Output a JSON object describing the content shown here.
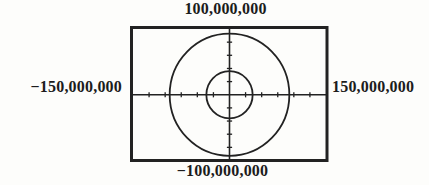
{
  "figure": {
    "window_labels": {
      "ymax": "100,000,000",
      "ymin": "−100,000,000",
      "xmin": "−150,000,000",
      "xmax": "150,000,000"
    }
  },
  "chart_data": {
    "type": "line",
    "title": "",
    "xlabel": "",
    "ylabel": "",
    "xlim": [
      -150000000,
      150000000
    ],
    "ylim": [
      -100000000,
      100000000
    ],
    "xscl": 25000000,
    "yscl": 20000000,
    "grid": false,
    "legend": false,
    "axis_edge_labels": {
      "top": "100,000,000",
      "bottom": "−100,000,000",
      "left": "−150,000,000",
      "right": "150,000,000"
    },
    "series": [
      {
        "name": "outer circle",
        "shape": "circle",
        "center_x": 0,
        "center_y": 0,
        "radius": 93000000
      },
      {
        "name": "inner circle",
        "shape": "circle",
        "center_x": 0,
        "center_y": 0,
        "radius": 36000000
      }
    ]
  },
  "colors": {
    "ink": "#222222",
    "background": "#fdfdfb"
  }
}
